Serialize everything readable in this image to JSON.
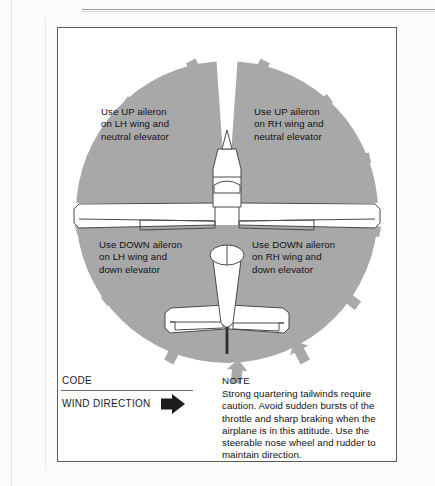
{
  "diagram": {
    "quadrants": [
      {
        "id": "upper-left",
        "label": "Use UP aileron\non LH wing and\nneutral elevator",
        "aileron": "UP",
        "wing": "LH",
        "elevator": "neutral"
      },
      {
        "id": "upper-right",
        "label": "Use UP aileron\non RH wing and\nneutral elevator",
        "aileron": "UP",
        "wing": "RH",
        "elevator": "neutral"
      },
      {
        "id": "lower-left",
        "label": "Use DOWN aileron\non LH wing and\ndown elevator",
        "aileron": "DOWN",
        "wing": "LH",
        "elevator": "down"
      },
      {
        "id": "lower-right",
        "label": "Use DOWN aileron\non RH wing and\ndown elevator",
        "aileron": "DOWN",
        "wing": "RH",
        "elevator": "down"
      }
    ],
    "aircraft": {
      "view": "top-down",
      "parts": [
        "spinner",
        "cowling",
        "windshield",
        "left-wing",
        "right-wing",
        "left-aileron",
        "right-aileron",
        "cabin",
        "fuselage",
        "horizontal-stabilizer",
        "left-elevator",
        "right-elevator",
        "tail-cone"
      ]
    },
    "wind_arrows": {
      "count": 12,
      "direction": "inward toward aircraft",
      "color": "#a8a8a8"
    },
    "colors": {
      "sector_gray": "#a8a8a8",
      "arrow_gray": "#a9a9a9",
      "outline": "#4a4a4a",
      "frame": "#5d5d5d",
      "text": "#111111",
      "code_arrow_black": "#1c1c1c"
    }
  },
  "code": {
    "heading": "CODE",
    "wind_label": "WIND DIRECTION",
    "arrow_icon": "wind-direction-arrow"
  },
  "note": {
    "heading": "NOTE",
    "body": "Strong quartering tailwinds require caution. Avoid sudden bursts of the throttle and sharp braking when the airplane is in this attitude. Use the steerable nose wheel and rudder to maintain direction."
  }
}
